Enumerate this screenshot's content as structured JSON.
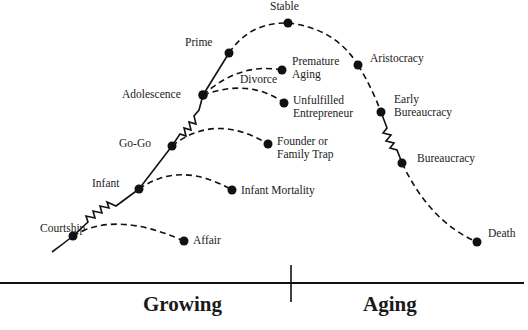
{
  "axis": {
    "left_label": "Growing",
    "right_label": "Aging"
  },
  "main_path": {
    "stages": [
      {
        "id": "courtship",
        "label": "Courtship"
      },
      {
        "id": "infant",
        "label": "Infant"
      },
      {
        "id": "go-go",
        "label": "Go-Go"
      },
      {
        "id": "adolescence",
        "label": "Adolescence"
      },
      {
        "id": "prime",
        "label": "Prime"
      },
      {
        "id": "stable",
        "label": "Stable"
      },
      {
        "id": "aristocracy",
        "label": "Aristocracy"
      },
      {
        "id": "early-bureaucracy",
        "label_line1": "Early",
        "label_line2": "Bureaucracy"
      },
      {
        "id": "bureaucracy",
        "label": "Bureaucracy"
      },
      {
        "id": "death",
        "label": "Death"
      }
    ]
  },
  "failure_paths": [
    {
      "from": "Courtship",
      "label": "Affair"
    },
    {
      "from": "Infant",
      "label": "Infant Mortality"
    },
    {
      "from": "Go-Go",
      "label_line1": "Founder or",
      "label_line2": "Family Trap"
    },
    {
      "from": "Adolescence",
      "label": "Divorce"
    },
    {
      "from": "Adolescence",
      "label_line1": "Premature",
      "label_line2": "Aging"
    },
    {
      "from": "Adolescence",
      "label_line1": "Unfulfilled",
      "label_line2": "Entrepreneur"
    }
  ]
}
